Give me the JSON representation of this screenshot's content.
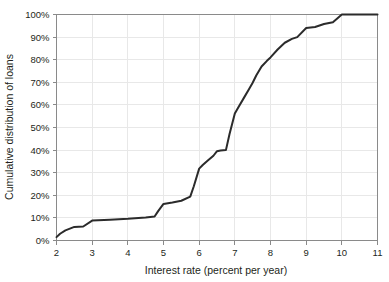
{
  "chart_data": {
    "type": "line",
    "title": "",
    "xlabel": "Interest rate (percent per year)",
    "ylabel": "Cumulative distribution of loans",
    "xlim": [
      2,
      11
    ],
    "ylim": [
      0,
      100
    ],
    "grid": true,
    "legend": false,
    "xticks": [
      2,
      3,
      4,
      5,
      6,
      7,
      8,
      9,
      10,
      11
    ],
    "xticklabels": [
      "2",
      "3",
      "4",
      "5",
      "6",
      "7",
      "8",
      "9",
      "10",
      "11"
    ],
    "yticks": [
      0,
      10,
      20,
      30,
      40,
      50,
      60,
      70,
      80,
      90,
      100
    ],
    "yticklabels": [
      "0%",
      "10%",
      "20%",
      "30%",
      "40%",
      "50%",
      "60%",
      "70%",
      "80%",
      "90%",
      "100%"
    ],
    "series": [
      {
        "name": "Cumulative distribution of loans",
        "color": "#2b2b2b",
        "x": [
          2.0,
          2.1,
          2.25,
          2.5,
          2.75,
          3.0,
          3.5,
          4.0,
          4.5,
          4.75,
          4.85,
          5.0,
          5.25,
          5.5,
          5.75,
          5.85,
          6.0,
          6.1,
          6.25,
          6.4,
          6.5,
          6.6,
          6.75,
          6.85,
          7.0,
          7.1,
          7.25,
          7.4,
          7.5,
          7.6,
          7.75,
          7.9,
          8.0,
          8.2,
          8.4,
          8.6,
          8.75,
          9.0,
          9.25,
          9.5,
          9.75,
          10.0,
          10.5,
          11.0
        ],
        "y": [
          1.5,
          3.0,
          4.5,
          6.0,
          6.2,
          8.8,
          9.2,
          9.6,
          10.2,
          10.6,
          13.0,
          16.2,
          16.8,
          17.6,
          19.4,
          24.0,
          31.8,
          33.4,
          35.5,
          37.5,
          39.5,
          39.8,
          40.0,
          47.0,
          56.2,
          59.0,
          63.0,
          67.0,
          69.8,
          73.0,
          77.0,
          79.5,
          81.0,
          84.5,
          87.5,
          89.2,
          90.0,
          94.0,
          94.5,
          95.8,
          96.6,
          100.0,
          100.0,
          100.0
        ]
      }
    ]
  },
  "axes": {
    "x_title": "Interest rate (percent per year)",
    "y_title": "Cumulative distribution of loans"
  },
  "colors": {
    "line": "#2b2b2b",
    "grid": "#e8e8e8",
    "spine": "#8a8a8a",
    "text": "#231f20",
    "background": "#ffffff"
  }
}
